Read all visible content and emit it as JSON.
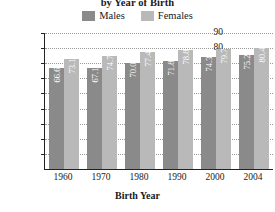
{
  "chart_data": {
    "type": "bar",
    "title": "by Year of Birth",
    "xlabel": "Birth Year",
    "ylabel": "Life Expectancy",
    "categories": [
      "1960",
      "1970",
      "1980",
      "1990",
      "2000",
      "2004"
    ],
    "series": [
      {
        "name": "Males",
        "color": "#8a8a8a",
        "values": [
          66.6,
          67.1,
          70.0,
          71.8,
          74.3,
          75.2
        ]
      },
      {
        "name": "Females",
        "color": "#b9b9b9",
        "values": [
          73.1,
          74.7,
          77.4,
          78.8,
          79.7,
          80.4
        ]
      }
    ],
    "ylim": [
      0,
      90
    ],
    "yticks": [
      90,
      80,
      70,
      60,
      50,
      40,
      30,
      20,
      10
    ],
    "grid": true,
    "legend_position": "top-center"
  }
}
